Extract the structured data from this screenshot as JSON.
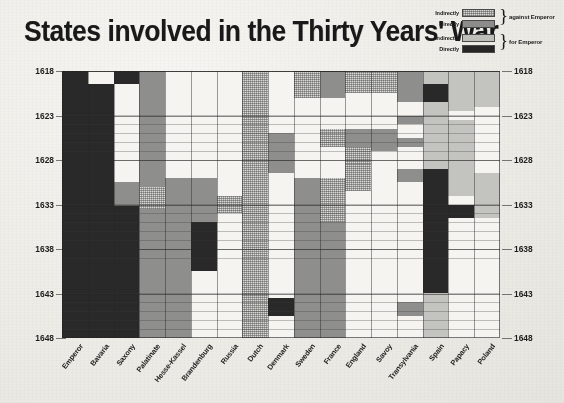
{
  "title": "States involved in the Thirty Years' War",
  "legend": {
    "rows": [
      {
        "label": "Indirectly",
        "swatch": "indirectly-against-emperor",
        "color": "#d6d6d2"
      },
      {
        "label": "Directly",
        "swatch": "directly-against-emperor",
        "color": "#8c8c8a"
      },
      {
        "label": "Indirectly",
        "swatch": "indirectly-for-emperor",
        "color": "#bdbdba"
      },
      {
        "label": "Directly",
        "swatch": "directly-for-emperor",
        "color": "#282828"
      }
    ],
    "groups": [
      {
        "label": "against Emperor"
      },
      {
        "label": "for Emperor"
      }
    ]
  },
  "chart_data": {
    "type": "heatmap",
    "title": "States involved in the Thirty Years' War",
    "xlabel": "",
    "ylabel": "",
    "ylim": [
      1618,
      1648
    ],
    "grid": true,
    "legend_position": "top-right",
    "y_ticks": [
      1618,
      1623,
      1628,
      1633,
      1638,
      1643,
      1648
    ],
    "y_axis_both_sides": true,
    "categories": [
      "Emperor",
      "Bavaria",
      "Saxony",
      "Palatinate",
      "Hesse-Kassel",
      "Brandenburg",
      "Russia",
      "Dutch",
      "Denmark",
      "Sweden",
      "France",
      "England",
      "Savoy",
      "Transylvania",
      "Spain",
      "Papacy",
      "Poland"
    ],
    "value_levels": [
      {
        "key": "indirectly-against",
        "label": "Indirectly against Emperor",
        "color": "#d8d8d4"
      },
      {
        "key": "directly-against",
        "label": "Directly against Emperor",
        "color": "#8e8e8c"
      },
      {
        "key": "indirectly-for",
        "label": "Indirectly for Emperor",
        "color": "#c2c2bf"
      },
      {
        "key": "directly-for",
        "label": "Directly for Emperor",
        "color": "#2b2b2b"
      }
    ],
    "spans": [
      {
        "state": "Emperor",
        "from": 1618.0,
        "to": 1648.0,
        "level": "directly-for"
      },
      {
        "state": "Bavaria",
        "from": 1619.5,
        "to": 1648.0,
        "level": "directly-for"
      },
      {
        "state": "Bavaria",
        "from": 1647.2,
        "to": 1648.0,
        "level": "none"
      },
      {
        "state": "Saxony",
        "from": 1618.0,
        "to": 1619.5,
        "level": "directly-for"
      },
      {
        "state": "Saxony",
        "from": 1630.5,
        "to": 1633.2,
        "level": "directly-against"
      },
      {
        "state": "Saxony",
        "from": 1633.2,
        "to": 1648.0,
        "level": "directly-for"
      },
      {
        "state": "Palatinate",
        "from": 1618.0,
        "to": 1631.0,
        "level": "directly-against"
      },
      {
        "state": "Palatinate",
        "from": 1631.0,
        "to": 1633.5,
        "level": "indirectly-against"
      },
      {
        "state": "Palatinate",
        "from": 1633.5,
        "to": 1648.0,
        "level": "directly-against"
      },
      {
        "state": "Hesse-Kassel",
        "from": 1630.0,
        "to": 1635.5,
        "level": "directly-against"
      },
      {
        "state": "Hesse-Kassel",
        "from": 1635.5,
        "to": 1648.0,
        "level": "directly-against"
      },
      {
        "state": "Brandenburg",
        "from": 1630.0,
        "to": 1635.0,
        "level": "directly-against"
      },
      {
        "state": "Brandenburg",
        "from": 1635.0,
        "to": 1640.5,
        "level": "directly-for"
      },
      {
        "state": "Brandenburg",
        "from": 1640.5,
        "to": 1648.0,
        "level": "none"
      },
      {
        "state": "Russia",
        "from": 1632.0,
        "to": 1634.0,
        "level": "indirectly-against"
      },
      {
        "state": "Dutch",
        "from": 1618.0,
        "to": 1648.0,
        "level": "indirectly-against"
      },
      {
        "state": "Denmark",
        "from": 1625.0,
        "to": 1629.5,
        "level": "directly-against"
      },
      {
        "state": "Denmark",
        "from": 1643.5,
        "to": 1645.5,
        "level": "directly-for"
      },
      {
        "state": "Sweden",
        "from": 1618.0,
        "to": 1621.0,
        "level": "indirectly-against"
      },
      {
        "state": "Sweden",
        "from": 1630.0,
        "to": 1648.0,
        "level": "directly-against"
      },
      {
        "state": "France",
        "from": 1618.0,
        "to": 1621.0,
        "level": "directly-against"
      },
      {
        "state": "France",
        "from": 1624.5,
        "to": 1626.5,
        "level": "indirectly-against"
      },
      {
        "state": "France",
        "from": 1630.0,
        "to": 1635.0,
        "level": "indirectly-against"
      },
      {
        "state": "France",
        "from": 1635.0,
        "to": 1648.0,
        "level": "directly-against"
      },
      {
        "state": "England",
        "from": 1618.0,
        "to": 1620.5,
        "level": "indirectly-against"
      },
      {
        "state": "England",
        "from": 1624.5,
        "to": 1626.5,
        "level": "directly-against"
      },
      {
        "state": "England",
        "from": 1626.5,
        "to": 1628.5,
        "level": "indirectly-against"
      },
      {
        "state": "England",
        "from": 1628.5,
        "to": 1631.5,
        "level": "indirectly-against"
      },
      {
        "state": "Savoy",
        "from": 1618.0,
        "to": 1620.5,
        "level": "indirectly-against"
      },
      {
        "state": "Savoy",
        "from": 1624.5,
        "to": 1627.0,
        "level": "directly-against"
      },
      {
        "state": "Transylvania",
        "from": 1618.0,
        "to": 1621.5,
        "level": "directly-against"
      },
      {
        "state": "Transylvania",
        "from": 1623.0,
        "to": 1624.0,
        "level": "directly-against"
      },
      {
        "state": "Transylvania",
        "from": 1625.5,
        "to": 1626.5,
        "level": "directly-against"
      },
      {
        "state": "Transylvania",
        "from": 1629.0,
        "to": 1630.5,
        "level": "directly-against"
      },
      {
        "state": "Transylvania",
        "from": 1644.0,
        "to": 1645.5,
        "level": "directly-against"
      },
      {
        "state": "Spain",
        "from": 1618.0,
        "to": 1619.5,
        "level": "indirectly-for"
      },
      {
        "state": "Spain",
        "from": 1619.5,
        "to": 1621.5,
        "level": "directly-for"
      },
      {
        "state": "Spain",
        "from": 1621.5,
        "to": 1629.0,
        "level": "indirectly-for"
      },
      {
        "state": "Spain",
        "from": 1629.0,
        "to": 1643.0,
        "level": "directly-for"
      },
      {
        "state": "Spain",
        "from": 1643.0,
        "to": 1648.0,
        "level": "indirectly-for"
      },
      {
        "state": "Papacy",
        "from": 1618.0,
        "to": 1622.5,
        "level": "indirectly-for"
      },
      {
        "state": "Papacy",
        "from": 1623.5,
        "to": 1632.0,
        "level": "indirectly-for"
      },
      {
        "state": "Papacy",
        "from": 1633.0,
        "to": 1634.5,
        "level": "directly-for"
      },
      {
        "state": "Poland",
        "from": 1618.0,
        "to": 1622.0,
        "level": "indirectly-for"
      },
      {
        "state": "Poland",
        "from": 1629.5,
        "to": 1634.5,
        "level": "indirectly-for"
      }
    ]
  }
}
